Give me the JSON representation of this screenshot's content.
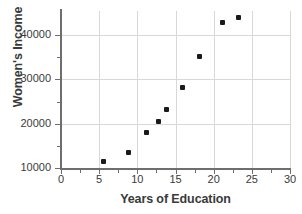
{
  "chart_data": {
    "type": "scatter",
    "title": "",
    "xlabel": "Years of Education",
    "ylabel": "Women's Income",
    "xlim": [
      0,
      30
    ],
    "ylim": [
      10000,
      45000
    ],
    "xticks": [
      0,
      5,
      10,
      15,
      20,
      25,
      30
    ],
    "ytick_labels": [
      "10000",
      "20000",
      "30000",
      "40000"
    ],
    "yticks": [
      10000,
      20000,
      30000,
      40000
    ],
    "grid": true,
    "legend": null,
    "series": [
      {
        "name": "Women's Income vs Years of Education",
        "marker": "square",
        "color": "#1a1a1a",
        "points": [
          {
            "x": 5.6,
            "y": 11500
          },
          {
            "x": 8.8,
            "y": 13400
          },
          {
            "x": 11.2,
            "y": 18100
          },
          {
            "x": 12.8,
            "y": 20600
          },
          {
            "x": 13.8,
            "y": 23300
          },
          {
            "x": 15.9,
            "y": 28100
          },
          {
            "x": 18.2,
            "y": 35100
          },
          {
            "x": 21.2,
            "y": 42800
          },
          {
            "x": 23.3,
            "y": 43900
          }
        ]
      }
    ]
  },
  "axis": {
    "x_title": "Years of Education",
    "y_title": "Women's Income",
    "x_tick_labels": [
      "0",
      "5",
      "10",
      "15",
      "20",
      "25",
      "30"
    ],
    "y_tick_labels": [
      "40000",
      "30000",
      "20000",
      "10000"
    ]
  },
  "colors": {
    "marker": "#1a1a1a",
    "gridline": "#d8d8d8",
    "axis": "#6e6e6e",
    "text": "#3a3a3a",
    "background": "#ffffff"
  }
}
